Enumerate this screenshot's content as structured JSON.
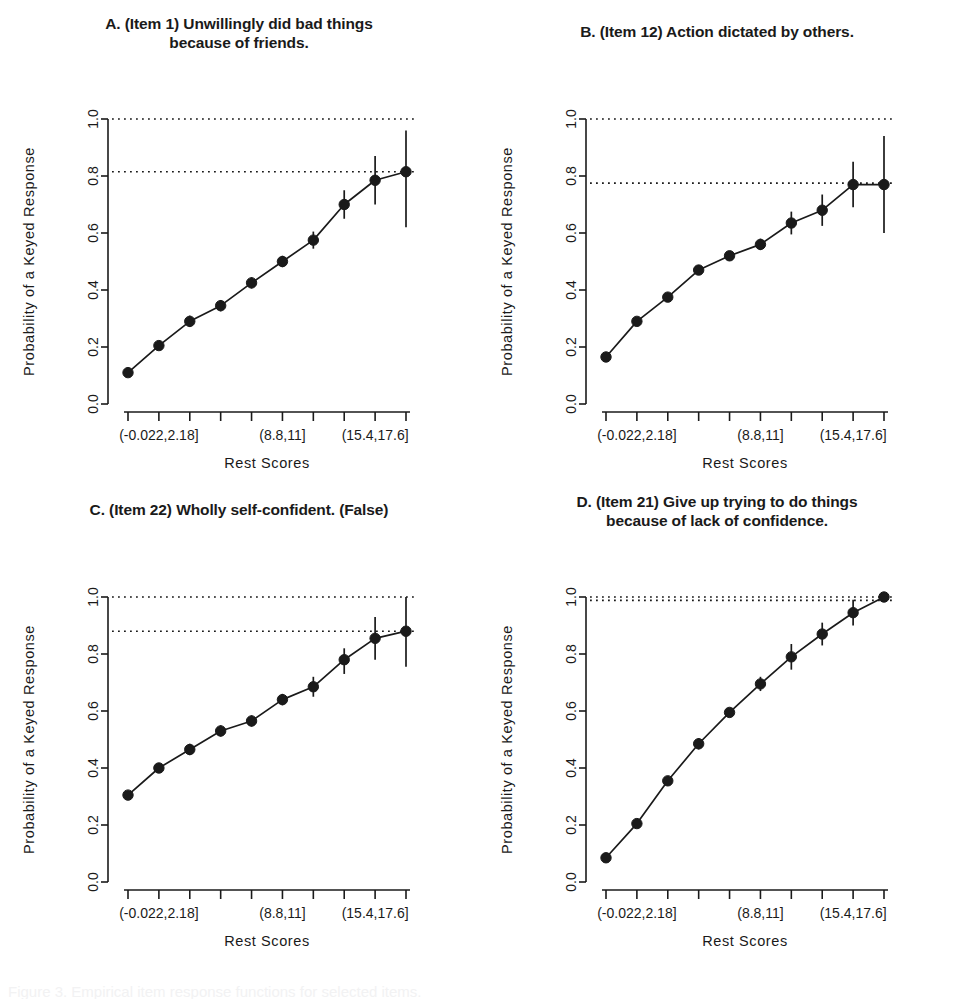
{
  "figure": {
    "panel_count": 4,
    "background": "#ffffff",
    "ink": "#1a1a1a",
    "caption_partial": "Figure 3. Empirical item response functions for selected items."
  },
  "axis": {
    "ylabel": "Probability of  a  Keyed  Response",
    "xlabel": "Rest Scores",
    "y_ticks": [
      "0.0",
      "0.2",
      "0.4",
      "0.6",
      "0.8",
      "1.0"
    ],
    "y_tick_values": [
      0.0,
      0.2,
      0.4,
      0.6,
      0.8,
      1.0
    ],
    "ylim": [
      0.0,
      1.0
    ],
    "x_category_labels": [
      "(-0.022,2.18]",
      "(8.8,11]",
      "(15.4,17.6]"
    ],
    "x_category_label_at_tick": [
      1,
      5,
      8
    ],
    "x_tick_count": 10
  },
  "chart_data": [
    {
      "id": "panel-a",
      "type": "line",
      "panel_letter": "A.",
      "title": "A.  (Item 1) Unwillingly did bad things\nbecause of friends.",
      "xlabel": "Rest Scores",
      "ylabel": "Probability of  a  Keyed  Response",
      "ylim": [
        0.0,
        1.0
      ],
      "grid": false,
      "legend": "none",
      "categories": [
        "(-0.022,2.18]",
        "2",
        "3",
        "4",
        "5",
        "(8.8,11]",
        "6",
        "7",
        "(15.4,17.6]",
        "10"
      ],
      "x": [
        1,
        2,
        3,
        4,
        5,
        6,
        7,
        8,
        9,
        10
      ],
      "values": [
        0.11,
        0.205,
        0.29,
        0.345,
        0.425,
        0.5,
        0.575,
        0.7,
        0.785,
        0.815
      ],
      "err_low": [
        0.11,
        0.205,
        0.27,
        0.325,
        0.405,
        0.48,
        0.545,
        0.65,
        0.7,
        0.62
      ],
      "err_high": [
        0.11,
        0.205,
        0.31,
        0.365,
        0.445,
        0.52,
        0.605,
        0.75,
        0.87,
        0.96
      ],
      "reference_lines": [
        1.0,
        0.815
      ]
    },
    {
      "id": "panel-b",
      "type": "line",
      "panel_letter": "B.",
      "title": "B.  (Item 12) Action dictated by others.",
      "xlabel": "Rest Scores",
      "ylabel": "Probability of  a  Keyed  Response",
      "ylim": [
        0.0,
        1.0
      ],
      "grid": false,
      "legend": "none",
      "categories": [
        "(-0.022,2.18]",
        "2",
        "3",
        "4",
        "5",
        "(8.8,11]",
        "6",
        "7",
        "(15.4,17.6]",
        "10"
      ],
      "x": [
        1,
        2,
        3,
        4,
        5,
        6,
        7,
        8,
        9,
        10
      ],
      "values": [
        0.165,
        0.29,
        0.375,
        0.47,
        0.52,
        0.56,
        0.635,
        0.68,
        0.77,
        0.77
      ],
      "err_low": [
        0.165,
        0.29,
        0.375,
        0.455,
        0.505,
        0.54,
        0.595,
        0.625,
        0.69,
        0.6
      ],
      "err_high": [
        0.165,
        0.29,
        0.375,
        0.485,
        0.535,
        0.58,
        0.675,
        0.735,
        0.85,
        0.94
      ],
      "reference_lines": [
        1.0,
        0.775
      ]
    },
    {
      "id": "panel-c",
      "type": "line",
      "panel_letter": "C.",
      "title": "C.  (Item 22) Wholly self-confident. (False)",
      "xlabel": "Rest Scores",
      "ylabel": "Probability of  a  Keyed  Response",
      "ylim": [
        0.0,
        1.0
      ],
      "grid": false,
      "legend": "none",
      "categories": [
        "(-0.022,2.18]",
        "2",
        "3",
        "4",
        "5",
        "(8.8,11]",
        "6",
        "7",
        "(15.4,17.6]",
        "10"
      ],
      "x": [
        1,
        2,
        3,
        4,
        5,
        6,
        7,
        8,
        9,
        10
      ],
      "values": [
        0.305,
        0.4,
        0.465,
        0.53,
        0.565,
        0.64,
        0.685,
        0.78,
        0.855,
        0.88
      ],
      "err_low": [
        0.305,
        0.4,
        0.445,
        0.51,
        0.545,
        0.62,
        0.65,
        0.73,
        0.78,
        0.755
      ],
      "err_high": [
        0.305,
        0.4,
        0.485,
        0.55,
        0.585,
        0.66,
        0.72,
        0.82,
        0.93,
        1.0
      ],
      "reference_lines": [
        1.0,
        0.88
      ]
    },
    {
      "id": "panel-d",
      "type": "line",
      "panel_letter": "D.",
      "title": "D.  (Item 21) Give up trying to do things\nbecause of lack of confidence.",
      "xlabel": "Rest Scores",
      "ylabel": "Probability of  a  Keyed  Response",
      "ylim": [
        0.0,
        1.0
      ],
      "grid": false,
      "legend": "none",
      "categories": [
        "(-0.022,2.18]",
        "2",
        "3",
        "4",
        "5",
        "(8.8,11]",
        "6",
        "7",
        "(15.4,17.6]",
        "10"
      ],
      "x": [
        1,
        2,
        3,
        4,
        5,
        6,
        7,
        8,
        9,
        10
      ],
      "values": [
        0.085,
        0.205,
        0.355,
        0.485,
        0.595,
        0.695,
        0.79,
        0.87,
        0.945,
        1.0
      ],
      "err_low": [
        0.085,
        0.205,
        0.355,
        0.465,
        0.595,
        0.67,
        0.745,
        0.83,
        0.9,
        1.0
      ],
      "err_high": [
        0.085,
        0.205,
        0.355,
        0.505,
        0.595,
        0.72,
        0.835,
        0.91,
        0.99,
        1.0
      ],
      "reference_lines": [
        1.0,
        0.988
      ]
    }
  ]
}
